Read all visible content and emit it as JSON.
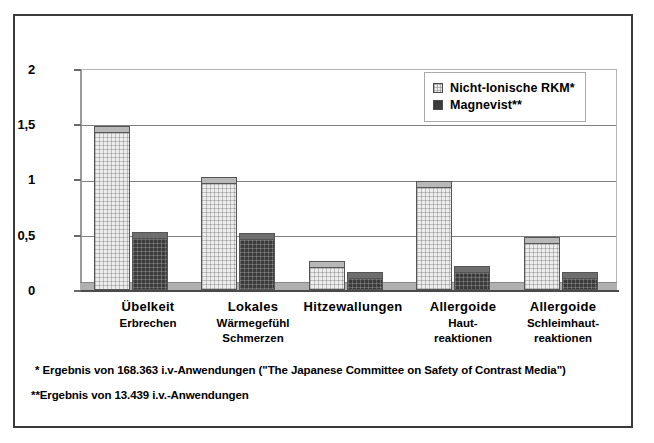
{
  "chart_data": {
    "type": "bar",
    "title": "",
    "xlabel": "",
    "ylabel": "",
    "ylim": [
      0,
      2
    ],
    "yticks": [
      "0",
      "0,5",
      "1",
      "1,5",
      "2"
    ],
    "ytick_values": [
      0,
      0.5,
      1,
      1.5,
      2
    ],
    "grid": true,
    "legend_position": "top-right",
    "categories": [
      "Übelkeit Erbrechen",
      "Lokales Wärmegefühl Schmerzen",
      "Hitzewallungen",
      "Allergoide Hautreaktionen",
      "Allergoide Schleimhautreaktionen"
    ],
    "series": [
      {
        "name": "Nicht-Ionische RKM*",
        "values": [
          1.42,
          0.96,
          0.2,
          0.92,
          0.42
        ],
        "color": "#ededed"
      },
      {
        "name": "Magnevist**",
        "values": [
          0.46,
          0.45,
          0.1,
          0.15,
          0.1
        ],
        "color": "#3b3b3b"
      }
    ]
  },
  "axis": {
    "ticks": [
      {
        "label": "2",
        "value": 2
      },
      {
        "label": "1,5",
        "value": 1.5
      },
      {
        "label": "1",
        "value": 1
      },
      {
        "label": "0,5",
        "value": 0.5
      },
      {
        "label": "0",
        "value": 0
      }
    ]
  },
  "legend": {
    "items": [
      {
        "label": "Nicht-Ionische RKM*",
        "swatch": "light-checker-swatch"
      },
      {
        "label": "Magnevist**",
        "swatch": "dark-solid-swatch"
      }
    ]
  },
  "categories": [
    {
      "line1": "Übelkeit",
      "line2": "Erbrechen",
      "line3": ""
    },
    {
      "line1": "Lokales",
      "line2": "Wärmegefühl",
      "line3": "Schmerzen"
    },
    {
      "line1": "Hitzewallungen",
      "line2": "",
      "line3": ""
    },
    {
      "line1": "Allergoide",
      "line2": "Haut-",
      "line3": "reaktionen"
    },
    {
      "line1": "Allergoide",
      "line2": "Schleimhaut-",
      "line3": "reaktionen"
    }
  ],
  "footnotes": {
    "first": "* Ergebnis von 168.363 i.v-Anwendungen (\"The Japanese Committee on Safety of  Contrast Media\")",
    "second": "**Ergebnis von 13.439 i.v.-Anwendungen"
  }
}
